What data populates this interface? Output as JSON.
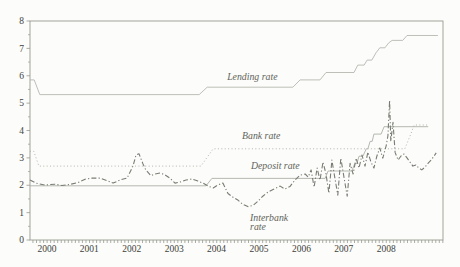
{
  "figure": {
    "background": "#fcfcfa",
    "frame_color": "#979b91",
    "axis_text_color": "#3e423b",
    "annotation_color": "#5f645b",
    "colors": {
      "lending": "#b5b8b0",
      "bank": "#b2b6ac",
      "deposit": "#adb1a8",
      "interbank": "#787d73"
    }
  },
  "chart_data": {
    "type": "line",
    "title": "",
    "xlabel": "",
    "ylabel": "",
    "grid": false,
    "legend_position": "inline-annotations",
    "x_axis": {
      "min": 1999.6,
      "max": 2009.34,
      "minor_tick_step_years": 0.08333,
      "tick_labels": [
        {
          "text": "2000",
          "t": 2000
        },
        {
          "text": "2001",
          "t": 2001
        },
        {
          "text": "2002",
          "t": 2002
        },
        {
          "text": "2003",
          "t": 2003
        },
        {
          "text": "2004",
          "t": 2004
        },
        {
          "text": "2005",
          "t": 2005
        },
        {
          "text": "2006",
          "t": 2006
        },
        {
          "text": "2007",
          "t": 2007
        },
        {
          "text": "2008",
          "t": 2008
        }
      ]
    },
    "y_axis": {
      "min": 0,
      "max": 8,
      "major_ticks": [
        0,
        1,
        2,
        3,
        4,
        5,
        6,
        7,
        8
      ],
      "minor_tick_step": 0.5
    },
    "annotations": [
      {
        "id": "lending-rate-label",
        "text": "Lending rate",
        "t": 2004.25,
        "v": 5.84
      },
      {
        "id": "bank-rate-label",
        "text": "Bank rate",
        "t": 2004.6,
        "v": 3.69
      },
      {
        "id": "deposit-rate-label",
        "text": "Deposit rate",
        "t": 2004.81,
        "v": 2.59
      },
      {
        "id": "interbank-rate-label-1",
        "text": "Interbank",
        "t": 2004.79,
        "v": 0.71
      },
      {
        "id": "interbank-rate-label-2",
        "text": "rate",
        "t": 2004.79,
        "v": 0.35
      }
    ],
    "series": [
      {
        "name": "Lending rate",
        "style": "solid",
        "color_key": "lending",
        "width": 0.9,
        "points": [
          [
            1999.6,
            5.85
          ],
          [
            1999.7,
            5.85
          ],
          [
            1999.83,
            5.31
          ],
          [
            2003.59,
            5.31
          ],
          [
            2003.78,
            5.58
          ],
          [
            2005.8,
            5.58
          ],
          [
            2005.97,
            5.85
          ],
          [
            2006.44,
            5.85
          ],
          [
            2006.58,
            6.12
          ],
          [
            2007.24,
            6.12
          ],
          [
            2007.33,
            6.39
          ],
          [
            2007.48,
            6.39
          ],
          [
            2007.55,
            6.57
          ],
          [
            2007.66,
            6.57
          ],
          [
            2007.76,
            6.84
          ],
          [
            2007.85,
            7.02
          ],
          [
            2007.97,
            7.02
          ],
          [
            2008.06,
            7.2
          ],
          [
            2008.14,
            7.29
          ],
          [
            2008.39,
            7.29
          ],
          [
            2008.49,
            7.47
          ],
          [
            2009.22,
            7.47
          ]
        ]
      },
      {
        "name": "Bank rate",
        "style": "dotted",
        "color_key": "bank",
        "width": 1.0,
        "points": [
          [
            1999.6,
            3.24
          ],
          [
            1999.69,
            3.24
          ],
          [
            1999.81,
            2.7
          ],
          [
            2003.63,
            2.7
          ],
          [
            2003.92,
            3.33
          ],
          [
            2008.44,
            3.33
          ],
          [
            2008.51,
            3.6
          ],
          [
            2008.58,
            3.87
          ],
          [
            2008.66,
            4.2
          ],
          [
            2008.99,
            4.2
          ]
        ]
      },
      {
        "name": "Deposit rate",
        "style": "solid",
        "color_key": "deposit",
        "width": 0.9,
        "points": [
          [
            1999.6,
            1.98
          ],
          [
            2003.75,
            1.98
          ],
          [
            2003.89,
            2.25
          ],
          [
            2006.56,
            2.25
          ],
          [
            2006.63,
            2.52
          ],
          [
            2007.19,
            2.52
          ],
          [
            2007.26,
            2.79
          ],
          [
            2007.31,
            2.79
          ],
          [
            2007.36,
            3.06
          ],
          [
            2007.45,
            3.06
          ],
          [
            2007.53,
            3.33
          ],
          [
            2007.57,
            3.33
          ],
          [
            2007.62,
            3.6
          ],
          [
            2007.67,
            3.6
          ],
          [
            2007.71,
            3.87
          ],
          [
            2007.88,
            3.87
          ],
          [
            2007.95,
            4.14
          ],
          [
            2008.99,
            4.14
          ]
        ]
      },
      {
        "name": "Interbank rate",
        "style": "dashdot",
        "color_key": "interbank",
        "width": 1.1,
        "points": [
          [
            1999.6,
            2.19
          ],
          [
            1999.74,
            2.08
          ],
          [
            1999.95,
            2.01
          ],
          [
            2000.19,
            2.04
          ],
          [
            2000.35,
            1.99
          ],
          [
            2000.54,
            2.03
          ],
          [
            2000.73,
            2.1
          ],
          [
            2000.9,
            2.22
          ],
          [
            2001.06,
            2.26
          ],
          [
            2001.25,
            2.26
          ],
          [
            2001.44,
            2.15
          ],
          [
            2001.56,
            2.08
          ],
          [
            2001.72,
            2.19
          ],
          [
            2001.89,
            2.26
          ],
          [
            2002.03,
            2.7
          ],
          [
            2002.1,
            3.1
          ],
          [
            2002.17,
            3.15
          ],
          [
            2002.26,
            2.8
          ],
          [
            2002.33,
            2.56
          ],
          [
            2002.45,
            2.35
          ],
          [
            2002.55,
            2.41
          ],
          [
            2002.67,
            2.45
          ],
          [
            2002.78,
            2.38
          ],
          [
            2002.9,
            2.26
          ],
          [
            2003.02,
            2.08
          ],
          [
            2003.14,
            2.12
          ],
          [
            2003.28,
            2.19
          ],
          [
            2003.42,
            2.23
          ],
          [
            2003.56,
            2.15
          ],
          [
            2003.68,
            2.08
          ],
          [
            2003.8,
            1.97
          ],
          [
            2003.92,
            1.9
          ],
          [
            2004.03,
            2.01
          ],
          [
            2004.15,
            2.08
          ],
          [
            2004.27,
            1.7
          ],
          [
            2004.39,
            1.56
          ],
          [
            2004.51,
            1.45
          ],
          [
            2004.62,
            1.3
          ],
          [
            2004.74,
            1.22
          ],
          [
            2004.86,
            1.26
          ],
          [
            2004.98,
            1.42
          ],
          [
            2005.09,
            1.6
          ],
          [
            2005.21,
            1.75
          ],
          [
            2005.31,
            1.83
          ],
          [
            2005.4,
            1.9
          ],
          [
            2005.5,
            1.97
          ],
          [
            2005.61,
            1.86
          ],
          [
            2005.73,
            1.95
          ],
          [
            2005.85,
            2.19
          ],
          [
            2005.97,
            2.37
          ],
          [
            2006.09,
            2.41
          ],
          [
            2006.16,
            2.3
          ],
          [
            2006.23,
            2.56
          ],
          [
            2006.3,
            1.93
          ],
          [
            2006.37,
            2.63
          ],
          [
            2006.44,
            2.19
          ],
          [
            2006.51,
            2.85
          ],
          [
            2006.58,
            2.41
          ],
          [
            2006.65,
            1.71
          ],
          [
            2006.72,
            2.92
          ],
          [
            2006.79,
            2.26
          ],
          [
            2006.86,
            1.64
          ],
          [
            2006.93,
            2.99
          ],
          [
            2007.0,
            2.33
          ],
          [
            2007.08,
            1.6
          ],
          [
            2007.15,
            2.8
          ],
          [
            2007.22,
            2.41
          ],
          [
            2007.29,
            2.99
          ],
          [
            2007.36,
            2.63
          ],
          [
            2007.43,
            3.1
          ],
          [
            2007.5,
            2.7
          ],
          [
            2007.57,
            3.21
          ],
          [
            2007.64,
            2.85
          ],
          [
            2007.71,
            2.63
          ],
          [
            2007.78,
            3.07
          ],
          [
            2007.85,
            3.36
          ],
          [
            2007.92,
            2.99
          ],
          [
            2008.0,
            3.45
          ],
          [
            2008.04,
            3.8
          ],
          [
            2008.08,
            5.1
          ],
          [
            2008.11,
            3.6
          ],
          [
            2008.16,
            4.3
          ],
          [
            2008.21,
            3.2
          ],
          [
            2008.28,
            2.92
          ],
          [
            2008.35,
            3.07
          ],
          [
            2008.42,
            3.14
          ],
          [
            2008.49,
            3.0
          ],
          [
            2008.56,
            2.85
          ],
          [
            2008.63,
            2.7
          ],
          [
            2008.7,
            2.74
          ],
          [
            2008.77,
            2.63
          ],
          [
            2008.84,
            2.56
          ],
          [
            2008.92,
            2.67
          ],
          [
            2008.99,
            2.81
          ],
          [
            2009.06,
            2.92
          ],
          [
            2009.13,
            3.07
          ],
          [
            2009.18,
            3.18
          ]
        ]
      }
    ]
  }
}
